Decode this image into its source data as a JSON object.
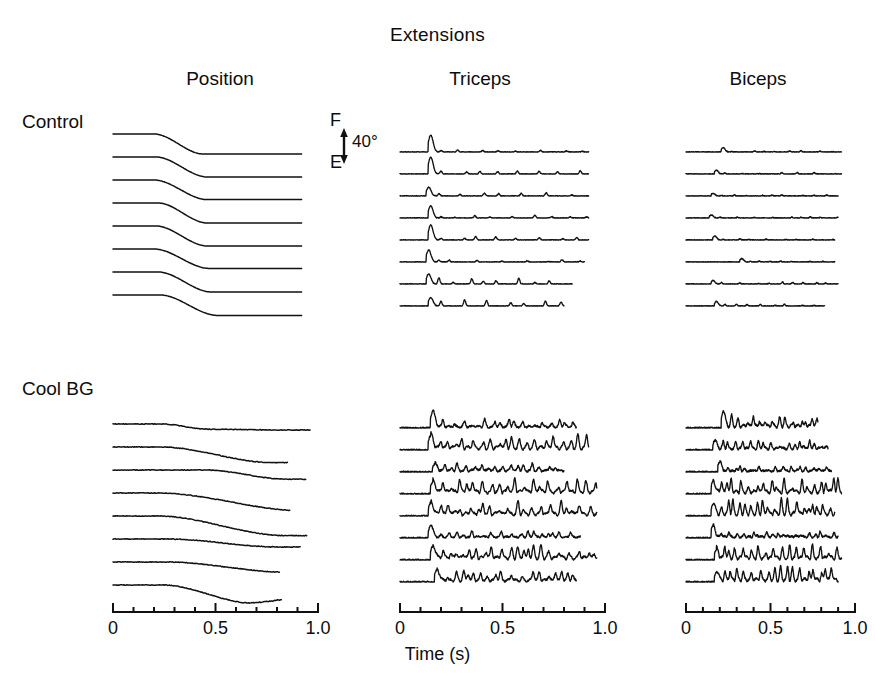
{
  "figure": {
    "title": "Extensions",
    "columns": [
      {
        "key": "position",
        "label": "Position"
      },
      {
        "key": "triceps",
        "label": "Triceps"
      },
      {
        "key": "biceps",
        "label": "Biceps"
      }
    ],
    "rows": [
      {
        "key": "control",
        "label": "Control"
      },
      {
        "key": "coolbg",
        "label": "Cool BG"
      }
    ],
    "calibration": {
      "top_label": "F",
      "bottom_label": "E",
      "magnitude": "40°",
      "icon": "double-arrow-vertical-icon"
    },
    "axis": {
      "xlabel": "Time (s)",
      "ticks": [
        "0",
        "0.5",
        "1.0"
      ],
      "minor_ticks_per_major": 5,
      "range": [
        0,
        1.0
      ]
    },
    "line_color": "#111111",
    "background_color": "#ffffff"
  },
  "chart_data": {
    "type": "line",
    "title": "Extensions",
    "xlabel": "Time (s)",
    "ylabel": "",
    "xlim": [
      0,
      1.0
    ],
    "grid": false,
    "legend": "none",
    "panels": [
      {
        "row": "Control",
        "column": "Position",
        "signal": "joint-position",
        "trials": 8,
        "units": "degrees",
        "calibration_deg": 40,
        "summary": "Smooth monotonic sigmoid step from flexion (F) to extension (E); movement onset near t=0.20 s, completed by t=0.45 s.",
        "onset_s": 0.2,
        "settle_s": 0.45,
        "amplitude_deg": 40,
        "series": [
          {
            "name": "trial-1",
            "onset": 0.2,
            "duration": 0.24,
            "amplitude": 1.0,
            "overshoot": 0.0
          },
          {
            "name": "trial-2",
            "onset": 0.21,
            "duration": 0.25,
            "amplitude": 1.0,
            "overshoot": 0.0
          },
          {
            "name": "trial-3",
            "onset": 0.2,
            "duration": 0.26,
            "amplitude": 0.98,
            "overshoot": 0.0
          },
          {
            "name": "trial-4",
            "onset": 0.22,
            "duration": 0.24,
            "amplitude": 1.0,
            "overshoot": 0.0
          },
          {
            "name": "trial-5",
            "onset": 0.21,
            "duration": 0.25,
            "amplitude": 1.0,
            "overshoot": 0.0
          },
          {
            "name": "trial-6",
            "onset": 0.2,
            "duration": 0.27,
            "amplitude": 0.97,
            "overshoot": 0.0
          },
          {
            "name": "trial-7",
            "onset": 0.22,
            "duration": 0.26,
            "amplitude": 1.0,
            "overshoot": 0.0
          },
          {
            "name": "trial-8",
            "onset": 0.23,
            "duration": 0.28,
            "amplitude": 1.02,
            "overshoot": 0.0
          }
        ]
      },
      {
        "row": "Control",
        "column": "Triceps",
        "signal": "emg-rectified",
        "trials": 8,
        "summary": "Single large agonist burst at t≈0.15 s followed by low-amplitude rhythmic spiking for the remainder of the trial.",
        "burst_onset_s": 0.14,
        "burst_peak_amplitude": 1.0,
        "tonic_amplitude": 0.16,
        "series": [
          {
            "name": "trial-1",
            "burst_t": 0.15,
            "burst_amp": 1.0,
            "tonic": 0.13,
            "end": 0.92
          },
          {
            "name": "trial-2",
            "burst_t": 0.15,
            "burst_amp": 1.0,
            "tonic": 0.18,
            "end": 0.92
          },
          {
            "name": "trial-3",
            "burst_t": 0.14,
            "burst_amp": 0.52,
            "tonic": 0.18,
            "end": 0.92
          },
          {
            "name": "trial-4",
            "burst_t": 0.15,
            "burst_amp": 0.72,
            "tonic": 0.15,
            "end": 0.92
          },
          {
            "name": "trial-5",
            "burst_t": 0.15,
            "burst_amp": 0.88,
            "tonic": 0.26,
            "end": 0.92
          },
          {
            "name": "trial-6",
            "burst_t": 0.14,
            "burst_amp": 0.7,
            "tonic": 0.14,
            "end": 0.9
          },
          {
            "name": "trial-7",
            "burst_t": 0.14,
            "burst_amp": 0.58,
            "tonic": 0.34,
            "end": 0.84
          },
          {
            "name": "trial-8",
            "burst_t": 0.15,
            "burst_amp": 0.5,
            "tonic": 0.34,
            "end": 0.8
          }
        ]
      },
      {
        "row": "Control",
        "column": "Biceps",
        "signal": "emg-rectified",
        "trials": 8,
        "summary": "Antagonist nearly silent; only small low-amplitude fluctuations around t=0.15–0.35 s, then flat baseline.",
        "burst_onset_s": 0.16,
        "burst_peak_amplitude": 0.24,
        "tonic_amplitude": 0.07,
        "series": [
          {
            "name": "trial-1",
            "burst_t": 0.22,
            "burst_amp": 0.26,
            "tonic": 0.07,
            "end": 0.92
          },
          {
            "name": "trial-2",
            "burst_t": 0.18,
            "burst_amp": 0.22,
            "tonic": 0.08,
            "end": 0.92
          },
          {
            "name": "trial-3",
            "burst_t": 0.16,
            "burst_amp": 0.16,
            "tonic": 0.07,
            "end": 0.9
          },
          {
            "name": "trial-4",
            "burst_t": 0.15,
            "burst_amp": 0.18,
            "tonic": 0.06,
            "end": 0.9
          },
          {
            "name": "trial-5",
            "burst_t": 0.17,
            "burst_amp": 0.24,
            "tonic": 0.06,
            "end": 0.88
          },
          {
            "name": "trial-6",
            "burst_t": 0.33,
            "burst_amp": 0.2,
            "tonic": 0.05,
            "end": 0.88
          },
          {
            "name": "trial-7",
            "burst_t": 0.16,
            "burst_amp": 0.2,
            "tonic": 0.12,
            "end": 0.9
          },
          {
            "name": "trial-8",
            "burst_t": 0.18,
            "burst_amp": 0.26,
            "tonic": 0.1,
            "end": 0.82
          }
        ]
      },
      {
        "row": "Cool BG",
        "column": "Position",
        "signal": "joint-position",
        "trials": 8,
        "units": "degrees",
        "calibration_deg": 40,
        "summary": "Movements slowed and irregular; onset delayed, prolonged multi-phase drift toward extension, trajectories vary across trials and cross one another.",
        "onset_s": 0.22,
        "settle_s": 0.95,
        "amplitude_deg": 40,
        "series": [
          {
            "name": "trial-1",
            "onset": 0.24,
            "duration": 0.22,
            "amplitude": 0.26,
            "overshoot": 0.04
          },
          {
            "name": "trial-2",
            "onset": 0.23,
            "duration": 0.55,
            "amplitude": 0.78,
            "overshoot": 0.0
          },
          {
            "name": "trial-3",
            "onset": 0.45,
            "duration": 0.4,
            "amplitude": 0.46,
            "overshoot": 0.0
          },
          {
            "name": "trial-4",
            "onset": 0.22,
            "duration": 0.7,
            "amplitude": 0.88,
            "overshoot": 0.0
          },
          {
            "name": "trial-5",
            "onset": 0.22,
            "duration": 0.62,
            "amplitude": 0.98,
            "overshoot": 0.0
          },
          {
            "name": "trial-6",
            "onset": 0.26,
            "duration": 0.55,
            "amplitude": 0.4,
            "overshoot": 0.0
          },
          {
            "name": "trial-7",
            "onset": 0.26,
            "duration": 0.6,
            "amplitude": 0.52,
            "overshoot": -0.16
          },
          {
            "name": "trial-8",
            "onset": 0.24,
            "duration": 0.45,
            "amplitude": 0.92,
            "overshoot": -0.42
          }
        ]
      },
      {
        "row": "Cool BG",
        "column": "Triceps",
        "signal": "emg-rectified",
        "trials": 8,
        "summary": "Initial burst followed by sustained high-amplitude, high-frequency oscillatory activity persisting through the whole trial (tremor-like).",
        "burst_onset_s": 0.15,
        "burst_peak_amplitude": 1.0,
        "tonic_amplitude": 0.58,
        "series": [
          {
            "name": "trial-1",
            "burst_t": 0.16,
            "burst_amp": 0.96,
            "tonic": 0.4,
            "end": 0.86
          },
          {
            "name": "trial-2",
            "burst_t": 0.15,
            "burst_amp": 0.84,
            "tonic": 0.72,
            "end": 0.92
          },
          {
            "name": "trial-3",
            "burst_t": 0.17,
            "burst_amp": 0.46,
            "tonic": 0.42,
            "end": 0.8
          },
          {
            "name": "trial-4",
            "burst_t": 0.16,
            "burst_amp": 0.7,
            "tonic": 0.7,
            "end": 0.96
          },
          {
            "name": "trial-5",
            "burst_t": 0.15,
            "burst_amp": 0.78,
            "tonic": 0.66,
            "end": 0.96
          },
          {
            "name": "trial-6",
            "burst_t": 0.15,
            "burst_amp": 0.7,
            "tonic": 0.3,
            "end": 0.88
          },
          {
            "name": "trial-7",
            "burst_t": 0.16,
            "burst_amp": 0.8,
            "tonic": 0.7,
            "end": 0.96
          },
          {
            "name": "trial-8",
            "burst_t": 0.18,
            "burst_amp": 0.7,
            "tonic": 0.5,
            "end": 0.86
          }
        ]
      },
      {
        "row": "Cool BG",
        "column": "Biceps",
        "signal": "emg-rectified",
        "trials": 8,
        "summary": "Antagonist strongly and abnormally co-activated: large repetitive bursts of sustained high-amplitude activity throughout the movement.",
        "burst_onset_s": 0.15,
        "burst_peak_amplitude": 1.0,
        "tonic_amplitude": 0.62,
        "series": [
          {
            "name": "trial-1",
            "burst_t": 0.22,
            "burst_amp": 0.92,
            "tonic": 0.62,
            "end": 0.78
          },
          {
            "name": "trial-2",
            "burst_t": 0.17,
            "burst_amp": 0.52,
            "tonic": 0.48,
            "end": 0.84
          },
          {
            "name": "trial-3",
            "burst_t": 0.2,
            "burst_amp": 0.58,
            "tonic": 0.3,
            "end": 0.86
          },
          {
            "name": "trial-4",
            "burst_t": 0.16,
            "burst_amp": 0.72,
            "tonic": 0.7,
            "end": 0.92
          },
          {
            "name": "trial-5",
            "burst_t": 0.16,
            "burst_amp": 0.66,
            "tonic": 0.78,
            "end": 0.88
          },
          {
            "name": "trial-6",
            "burst_t": 0.16,
            "burst_amp": 0.72,
            "tonic": 0.34,
            "end": 0.9
          },
          {
            "name": "trial-7",
            "burst_t": 0.18,
            "burst_amp": 0.6,
            "tonic": 0.68,
            "end": 0.92
          },
          {
            "name": "trial-8",
            "burst_t": 0.18,
            "burst_amp": 0.58,
            "tonic": 0.72,
            "end": 0.9
          }
        ]
      }
    ]
  }
}
